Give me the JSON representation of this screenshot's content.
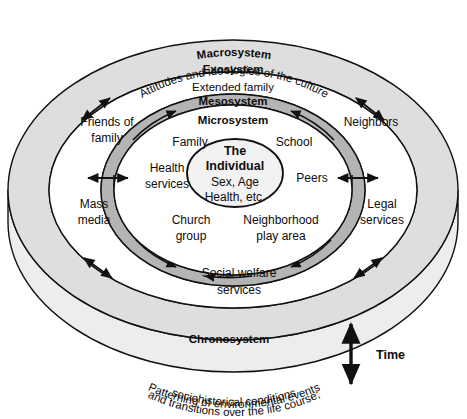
{
  "figure": {
    "type": "concentric-rings-diagram"
  },
  "rings": {
    "macrosystem": {
      "label": "Macrosystem",
      "description": "Attitudes and ideologies of the culture",
      "fill": "#dedede"
    },
    "exosystem": {
      "label": "Exosystem",
      "description": "Extended family",
      "fill": "#ffffff"
    },
    "mesosystem": {
      "label": "Mesosystem",
      "fill": "#b4b4b4"
    },
    "microsystem": {
      "label": "Microsystem",
      "fill": "#ffffff"
    },
    "chronosystem": {
      "label": "Chronosystem",
      "line1": "Patterning of environmental events",
      "line2": "and transitions over the life course;",
      "line3": "sociohistorical conditions",
      "fill": "#ededed"
    }
  },
  "center": {
    "line1": "The",
    "line2": "Individual",
    "line3": "Sex, Age",
    "line4": "Health, etc.",
    "fill": "#f2f2f2"
  },
  "microsystem_nodes": [
    {
      "id": "family",
      "label": "Family"
    },
    {
      "id": "school",
      "label": "School"
    },
    {
      "id": "health-services",
      "line1": "Health",
      "line2": "services"
    },
    {
      "id": "peers",
      "label": "Peers"
    },
    {
      "id": "church-group",
      "line1": "Church",
      "line2": "group"
    },
    {
      "id": "neighborhood-play-area",
      "line1": "Neighborhood",
      "line2": "play area"
    }
  ],
  "exosystem_nodes": [
    {
      "id": "friends-of-family",
      "line1": "Friends of",
      "line2": "family"
    },
    {
      "id": "neighbors",
      "label": "Neighbors"
    },
    {
      "id": "mass-media",
      "line1": "Mass",
      "line2": "media"
    },
    {
      "id": "legal-services",
      "line1": "Legal",
      "line2": "services"
    },
    {
      "id": "social-welfare-services",
      "line1": "Social welfare",
      "line2": "services"
    }
  ],
  "time_axis": {
    "label": "Time",
    "direction": "bidirectional-vertical"
  }
}
